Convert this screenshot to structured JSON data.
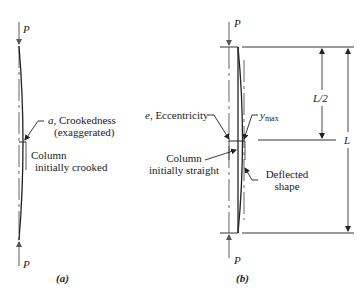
{
  "figure": {
    "panel_a": {
      "caption": "(a)",
      "load_top": "P",
      "load_bottom": "P",
      "crookedness_label_var": "a",
      "crookedness_label_text": ", Crookedness",
      "crookedness_label_note": "(exaggerated)",
      "column_label_line1": "Column",
      "column_label_line2": "initially crooked"
    },
    "panel_b": {
      "caption": "(b)",
      "load_top": "P",
      "load_bottom": "P",
      "eccentricity_var": "e",
      "eccentricity_text": ", Eccentricity",
      "ymax_var": "y",
      "ymax_sub": "max",
      "column_label_line1": "Column",
      "column_label_line2": "initially straight",
      "deflected_line1": "Deflected",
      "deflected_line2": "shape",
      "dim_half": "L/2",
      "dim_full": "L"
    }
  },
  "colors": {
    "line": "#333333",
    "arrow": "#555555",
    "text": "#222222"
  }
}
